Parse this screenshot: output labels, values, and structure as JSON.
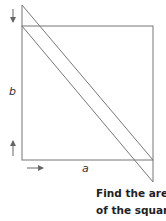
{
  "figure": {
    "labels": {
      "side_b": "b",
      "side_a": "a"
    },
    "caption": {
      "line1": "Find the area",
      "line2": "of the square"
    },
    "colors": {
      "stroke": "#777777",
      "text": "#222222",
      "background": "#ffffff"
    }
  }
}
